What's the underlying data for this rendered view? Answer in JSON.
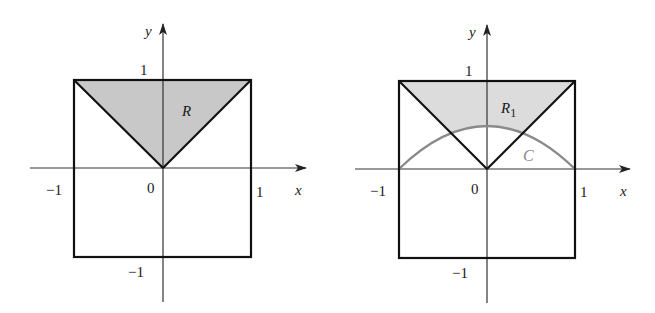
{
  "figure": {
    "panels": [
      {
        "id": "left",
        "region_label": "R",
        "region_subscript": "",
        "axis_x_label": "x",
        "axis_y_label": "y",
        "tick_labels": {
          "x_neg": "−1",
          "origin": "0",
          "x_pos": "1",
          "y_pos": "1",
          "y_neg": "−1"
        },
        "shaded_region": "triangle between y=|x| and y=1",
        "curve": null
      },
      {
        "id": "right",
        "region_label": "R",
        "region_subscript": "1",
        "axis_x_label": "x",
        "axis_y_label": "y",
        "tick_labels": {
          "x_neg": "−1",
          "origin": "0",
          "x_pos": "1",
          "y_pos": "1",
          "y_neg": "−1"
        },
        "shaded_region": "region between y=|x|, y=1 above curve C",
        "curve": {
          "label": "C",
          "color": "#8a8a8a",
          "shape": "arch from (-1,0) to (1,0), apex ≈ (0, 0.5)"
        }
      }
    ],
    "colors": {
      "shade": "#c8c8c8",
      "shade_light": "#dcdcdc",
      "lines": "#111111",
      "axes": "#333333",
      "curve": "#8a8a8a"
    }
  }
}
